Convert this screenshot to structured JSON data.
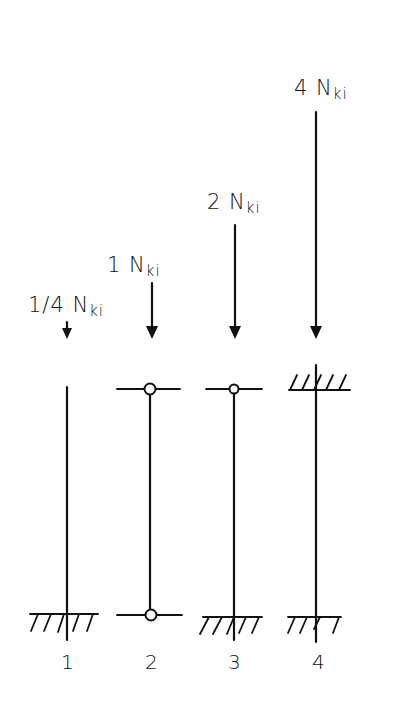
{
  "diagram": {
    "type": "buckling-cases-euler-columns",
    "columns": [
      {
        "id": "1",
        "number_label": "1",
        "load_label": "1/4 N",
        "load_subscript": "ki",
        "top_support": "free",
        "bottom_support": "fixed"
      },
      {
        "id": "2",
        "number_label": "2",
        "load_label": "1 N",
        "load_subscript": "ki",
        "top_support": "pinned",
        "bottom_support": "pinned"
      },
      {
        "id": "3",
        "number_label": "3",
        "load_label": "2 N",
        "load_subscript": "ki",
        "top_support": "pinned",
        "bottom_support": "fixed"
      },
      {
        "id": "4",
        "number_label": "4",
        "load_label": "4 N",
        "load_subscript": "ki",
        "top_support": "fixed",
        "bottom_support": "fixed"
      }
    ],
    "colors": {
      "ink": "#111111",
      "background": "#ffffff"
    }
  }
}
